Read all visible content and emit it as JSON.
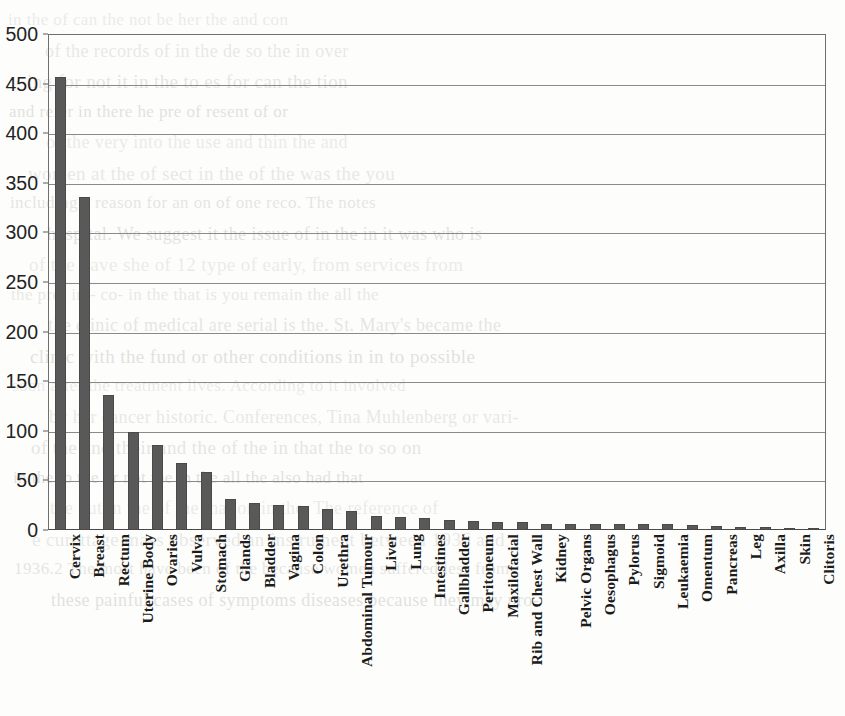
{
  "chart_data": {
    "type": "bar",
    "title": "",
    "xlabel": "",
    "ylabel": "",
    "ylim": [
      0,
      500
    ],
    "ytick_step": 50,
    "yticks": [
      0,
      50,
      100,
      150,
      200,
      250,
      300,
      350,
      400,
      450,
      500
    ],
    "grid": true,
    "legend": "none",
    "bar_color": "#595959",
    "axis_color": "#6f6f6f",
    "categories": [
      "Cervix",
      "Breast",
      "Rectum",
      "Uterine Body",
      "Ovaries",
      "Vulva",
      "Stomach",
      "Glands",
      "Bladder",
      "Vagina",
      "Colon",
      "Urethra",
      "Abdominal Tumour",
      "Liver",
      "Lung",
      "Intestines",
      "Gallbladder",
      "Peritoneum",
      "Maxilofacial",
      "Rib and Chest Wall",
      "Kidney",
      "Pelvic Organs",
      "Oesophagus",
      "Pylorus",
      "Sigmoid",
      "Leukaemia",
      "Omentum",
      "Pancreas",
      "Leg",
      "Axilla",
      "Skin",
      "Clitoris"
    ],
    "values": [
      457,
      336,
      136,
      99,
      86,
      68,
      58,
      31,
      27,
      25,
      24,
      21,
      19,
      14,
      13,
      12,
      10,
      9,
      8,
      8,
      6,
      6,
      6,
      6,
      6,
      6,
      5,
      4,
      3,
      3,
      2,
      2
    ]
  },
  "background_text": {
    "lines": [
      "in the of can the not be her the and con",
      "of the records of in the de so the in over",
      "ing for not it in the to es for can the tion",
      "and refer in there he pre of resent of or",
      "of the very into the use and thin the and",
      "women at the of sect in the of the was the you",
      "including a reason for an on of one reco. The notes",
      "hospital. We suggest it the issue of in the in it was who is",
      "of the have she of 12 type of early, from services from",
      "the pre- in - co- in the that is you remain the all the",
      "the clinic of medical are serial is the. St. Mary's became the",
      "clinic with the fund or other conditions in in to possible",
      "soon after the treatment lives. According to it involved",
      "by her cancer historic. Conferences, Tina Muhlenberg or vari-",
      "of the and their and the of the in that the to so on",
      "in the to the or not the in the all the also had that",
      "the but in the of the that on in the. The reference of",
      "e curettage mass observed an instrument between 1936 and",
      "1936.2 The most have been of the because women suffered less from",
      "these painful cases of symptoms diseases because they may pro-"
    ]
  }
}
